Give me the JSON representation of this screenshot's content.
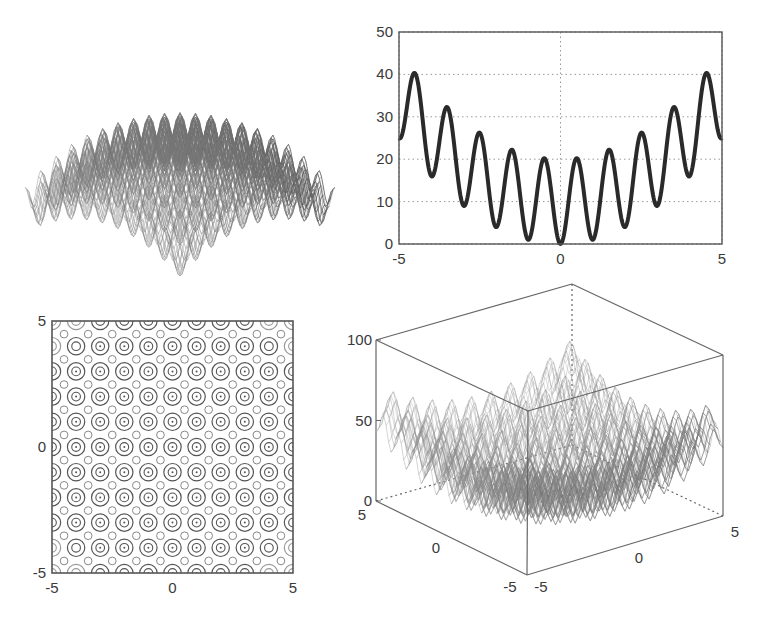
{
  "figure": {
    "width": 762,
    "height": 623,
    "background": "#ffffff",
    "line_color": "#2a2a2a",
    "axis_color": "#555555",
    "grid_color": "#9a9a9a"
  },
  "chart_data": [
    {
      "id": "surface-top-left",
      "type": "surface3d",
      "title": "",
      "function": "-(20 + x^2 + y^2 - 10cos(2πx) - 10cos(2πy))",
      "x_range": [
        -5,
        5
      ],
      "y_range": [
        -5,
        5
      ],
      "axes_visible": false,
      "shading": "grayscale",
      "bbox": {
        "x0": 12,
        "y0": 32,
        "x1": 345,
        "y1": 292
      }
    },
    {
      "id": "line-top-right",
      "type": "line",
      "title": "",
      "function": "10 + x^2 - 10cos(2πx)",
      "xlabel": "",
      "ylabel": "",
      "xlim": [
        -5,
        5
      ],
      "ylim": [
        0,
        50
      ],
      "x_ticks": [
        "-5",
        "0",
        "5"
      ],
      "y_ticks": [
        "0",
        "10",
        "20",
        "30",
        "40",
        "50"
      ],
      "grid": true,
      "x": [
        -5,
        -4.5,
        -4,
        -3.5,
        -3,
        -2.5,
        -2,
        -1.5,
        -1,
        -0.5,
        0,
        0.5,
        1,
        1.5,
        2,
        2.5,
        3,
        3.5,
        4,
        4.5,
        5
      ],
      "values": [
        25,
        40.25,
        16,
        32.25,
        9,
        26.25,
        4,
        22.25,
        1,
        20.25,
        0,
        20.25,
        1,
        22.25,
        4,
        26.25,
        9,
        32.25,
        16,
        40.25,
        25
      ],
      "bbox": {
        "x0": 399,
        "y0": 32,
        "x1": 722,
        "y1": 244
      }
    },
    {
      "id": "contour-bottom-left",
      "type": "contour",
      "title": "",
      "function": "20 + x^2 + y^2 - 10cos(2πx) - 10cos(2πy)",
      "xlim": [
        -5,
        5
      ],
      "ylim": [
        -5,
        5
      ],
      "x_ticks": [
        "-5",
        "0",
        "5"
      ],
      "y_ticks": [
        "-5",
        "0",
        "5"
      ],
      "levels": [
        5,
        15,
        30,
        45,
        60
      ],
      "bbox": {
        "x0": 52,
        "y0": 321,
        "x1": 293,
        "y1": 573
      }
    },
    {
      "id": "mesh-bottom-right",
      "type": "surface3d",
      "title": "",
      "function": "20 + x^2 + y^2 - 10cos(2πx) - 10cos(2πy)",
      "x_range": [
        -5,
        5
      ],
      "y_range": [
        -5,
        5
      ],
      "zlim": [
        0,
        100
      ],
      "z_ticks": [
        "0",
        "50",
        "100"
      ],
      "x_ticks": [
        "-5",
        "0",
        "5"
      ],
      "y_ticks": [
        "5",
        "0",
        "-5"
      ],
      "box_corners": {
        "top_left": [
          376,
          340
        ],
        "top_back": [
          572,
          284
        ],
        "top_right": [
          723,
          355
        ],
        "top_front": [
          528,
          411
        ],
        "bottom_left": [
          376,
          501
        ],
        "bottom_front": [
          527,
          575
        ],
        "bottom_right": [
          723,
          516
        ]
      }
    }
  ]
}
